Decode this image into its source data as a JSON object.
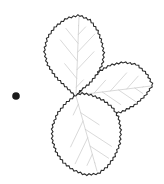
{
  "page": {
    "background": "#ffffff"
  },
  "bullet": {
    "icon": "filled-circle-bullet-icon",
    "color": "#1b1b1b"
  },
  "illustration": {
    "icon": "trifoliate-leaf-illustration",
    "subject": "black-and-white line drawing of a three-leaflet serrated leaf (bramble/strawberry type) with faint veins",
    "leaflets": [
      "top",
      "right",
      "bottom"
    ],
    "colors": {
      "outline": "#2b2b2b",
      "vein": "#c8c8c8",
      "fill": "#ffffff"
    }
  }
}
